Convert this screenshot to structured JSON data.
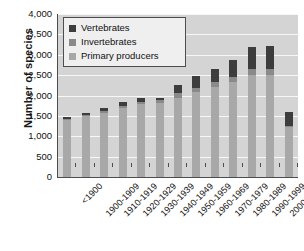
{
  "chart_data": {
    "type": "bar",
    "title": "",
    "subtitle": "",
    "xlabel": "",
    "ylabel": "Number of species",
    "ylim": [
      0,
      4000
    ],
    "ytick_values": [
      0,
      500,
      1000,
      1500,
      2000,
      2500,
      3000,
      3500,
      4000
    ],
    "ytick_labels": [
      "0",
      "500",
      "1,000",
      "1,500",
      "2,000",
      "2,500",
      "3,000",
      "3,500",
      "4,000"
    ],
    "grid": true,
    "grid_axis": "y",
    "stacked": true,
    "legend_position": "upper-left-inside",
    "plot_background": "#d4d4d4",
    "gridline_color": "#f7f7f7",
    "categories": [
      "<1900",
      "1900-1909",
      "1910-1919",
      "1920-1929",
      "1930-1939",
      "1940-1949",
      "1950-1959",
      "1960-1969",
      "1970-1979",
      "1980-1989",
      "1990-1999",
      "2000-2008",
      "Not known"
    ],
    "series": [
      {
        "name": "Primary producers",
        "color": "#a8a8a8",
        "values": [
          1400,
          1500,
          1580,
          1700,
          1780,
          1820,
          1950,
          2080,
          2220,
          2330,
          2500,
          2500,
          1230
        ]
      },
      {
        "name": "Invertebrates",
        "color": "#8a8a8a",
        "values": [
          30,
          30,
          40,
          50,
          60,
          70,
          100,
          110,
          120,
          130,
          150,
          150,
          30
        ]
      },
      {
        "name": "Vertebrates",
        "color": "#3d3d3d",
        "values": [
          40,
          40,
          70,
          90,
          100,
          50,
          220,
          290,
          320,
          420,
          550,
          560,
          340
        ]
      }
    ],
    "totals": [
      1470,
      1570,
      1690,
      1840,
      1940,
      1940,
      2270,
      2480,
      2660,
      2880,
      3200,
      3210,
      1600
    ]
  },
  "legend": {
    "items": [
      {
        "label": "Vertebrates",
        "color": "#3d3d3d"
      },
      {
        "label": "Invertebrates",
        "color": "#8a8a8a"
      },
      {
        "label": "Primary producers",
        "color": "#a8a8a8"
      }
    ]
  }
}
